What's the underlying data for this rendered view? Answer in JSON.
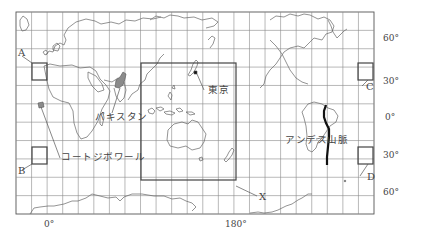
{
  "map": {
    "projection": "world-grid-map",
    "frame": {
      "x1": 16,
      "y1": 12,
      "x2": 374,
      "y2": 214
    },
    "longitude_labels": [
      {
        "text": "0°",
        "x": 44,
        "y": 222
      },
      {
        "text": "180°",
        "x": 226,
        "y": 222
      }
    ],
    "latitude_labels": [
      {
        "text": "60°",
        "x": 383,
        "y": 35
      },
      {
        "text": "30°",
        "x": 383,
        "y": 77
      },
      {
        "text": "0°",
        "x": 383,
        "y": 113
      },
      {
        "text": "30°",
        "x": 383,
        "y": 150
      },
      {
        "text": "60°",
        "x": 383,
        "y": 187
      }
    ],
    "boxes": [
      {
        "id": "A",
        "label": "A",
        "x": 32,
        "y": 63,
        "w": 15,
        "h": 17,
        "label_x": 18,
        "label_y": 48
      },
      {
        "id": "B",
        "label": "B",
        "x": 32,
        "y": 147,
        "w": 15,
        "h": 17,
        "label_x": 18,
        "label_y": 171
      },
      {
        "id": "C",
        "label": "C",
        "x": 358,
        "y": 63,
        "w": 15,
        "h": 17,
        "label_x": 366,
        "label_y": 86
      },
      {
        "id": "D",
        "label": "D",
        "x": 358,
        "y": 147,
        "w": 15,
        "h": 17,
        "label_x": 364,
        "label_y": 177
      },
      {
        "id": "X",
        "label": "X",
        "x": 141,
        "y": 63,
        "w": 95,
        "h": 117,
        "label_x": 259,
        "label_y": 196
      }
    ],
    "place_labels": [
      {
        "id": "tokyo",
        "text": "東京",
        "x": 208,
        "y": 88
      },
      {
        "id": "pakistan",
        "text": "パキスタン",
        "x": 95,
        "y": 115
      },
      {
        "id": "cote-divoire",
        "text": "コートジボワール",
        "x": 61,
        "y": 155
      },
      {
        "id": "andes",
        "text": "アンデス山脈",
        "x": 286,
        "y": 138
      }
    ],
    "colors": {
      "grid": "#777777",
      "coast": "#666666",
      "box": "#444444",
      "highlight": "#777777",
      "andes": "#111111"
    }
  }
}
